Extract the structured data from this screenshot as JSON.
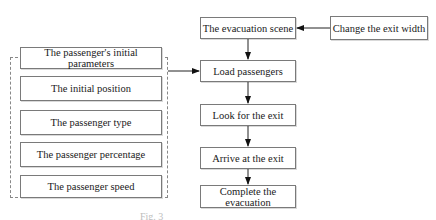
{
  "diagram": {
    "left_group": {
      "title": "The passenger's initial parameters",
      "items": [
        "The initial position",
        "The passenger type",
        "The passenger percentage",
        "The passenger speed"
      ]
    },
    "main_flow": [
      "The evacuation scene",
      "Load passengers",
      "Look for the exit",
      "Arrive at the exit",
      "Complete the evacuation"
    ],
    "side_input": "Change the exit width",
    "edges": [
      {
        "from": "Change the exit width",
        "to": "The evacuation scene"
      },
      {
        "from": "The passenger's initial parameters",
        "to": "Load passengers"
      },
      {
        "from": "The evacuation scene",
        "to": "Load passengers"
      },
      {
        "from": "Load passengers",
        "to": "Look for the exit"
      },
      {
        "from": "Look for the exit",
        "to": "Arrive at the exit"
      },
      {
        "from": "Arrive at the exit",
        "to": "Complete the evacuation"
      }
    ],
    "caption": "Fig. 3"
  }
}
